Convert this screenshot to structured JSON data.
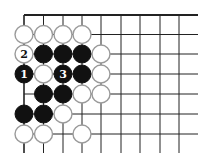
{
  "diagram": {
    "type": "go-board-fragment",
    "grid": {
      "columns_x": [
        24,
        43.5,
        63,
        82,
        101,
        121,
        140,
        160,
        179
      ],
      "rows_y": [
        15,
        34.5,
        54,
        74,
        94,
        114,
        134
      ],
      "top_line_end_x": 198,
      "right_lines_end_x": 198,
      "bottom_lines_end_y": 153,
      "line_color": "#222222",
      "top_edge_bold": true,
      "left_edge_bold": true
    },
    "stone_radius": 9,
    "colors": {
      "black": "#111111",
      "white_fill": "#ffffff",
      "white_stroke": "#9a9a9a"
    },
    "stones": [
      {
        "color": "white",
        "col": 0,
        "row": 1,
        "label": ""
      },
      {
        "color": "white",
        "col": 1,
        "row": 1,
        "label": ""
      },
      {
        "color": "white",
        "col": 2,
        "row": 1,
        "label": ""
      },
      {
        "color": "white",
        "col": 3,
        "row": 1,
        "label": ""
      },
      {
        "color": "white",
        "col": 0,
        "row": 2,
        "label": "2"
      },
      {
        "color": "black",
        "col": 1,
        "row": 2,
        "label": ""
      },
      {
        "color": "black",
        "col": 2,
        "row": 2,
        "label": ""
      },
      {
        "color": "black",
        "col": 3,
        "row": 2,
        "label": ""
      },
      {
        "color": "white",
        "col": 4,
        "row": 2,
        "label": ""
      },
      {
        "color": "black",
        "col": 0,
        "row": 3,
        "label": "1"
      },
      {
        "color": "white",
        "col": 1,
        "row": 3,
        "label": ""
      },
      {
        "color": "black",
        "col": 2,
        "row": 3,
        "label": "3"
      },
      {
        "color": "black",
        "col": 3,
        "row": 3,
        "label": ""
      },
      {
        "color": "white",
        "col": 4,
        "row": 3,
        "label": ""
      },
      {
        "color": "black",
        "col": 1,
        "row": 4,
        "label": ""
      },
      {
        "color": "black",
        "col": 2,
        "row": 4,
        "label": ""
      },
      {
        "color": "white",
        "col": 3,
        "row": 4,
        "label": ""
      },
      {
        "color": "white",
        "col": 4,
        "row": 4,
        "label": ""
      },
      {
        "color": "black",
        "col": 0,
        "row": 5,
        "label": ""
      },
      {
        "color": "black",
        "col": 1,
        "row": 5,
        "label": ""
      },
      {
        "color": "white",
        "col": 2,
        "row": 5,
        "label": ""
      },
      {
        "color": "white",
        "col": 0,
        "row": 6,
        "label": ""
      },
      {
        "color": "white",
        "col": 1,
        "row": 6,
        "label": ""
      },
      {
        "color": "white",
        "col": 3,
        "row": 6,
        "label": ""
      }
    ]
  }
}
